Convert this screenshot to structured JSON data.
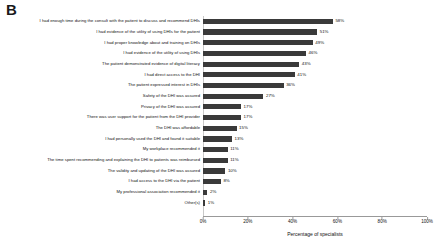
{
  "panel": {
    "label": "B"
  },
  "chart_data": {
    "type": "bar",
    "orientation": "horizontal",
    "title": "",
    "xlabel": "Percentage of specialists",
    "ylabel": "",
    "xlim": [
      0,
      100
    ],
    "grid": false,
    "legend": "none",
    "tick_labels": [
      "0%",
      "20%",
      "40%",
      "60%",
      "80%",
      "100%"
    ],
    "tick_values": [
      0,
      20,
      40,
      60,
      80,
      100
    ],
    "bar_color": "#3a3a3a",
    "categories": [
      "I had enough time during the consult with the patient to discuss and recommend DHIs",
      "I had evidence of the utility of using DHIs for the patient",
      "I had proper knowledge about and training on DHIs",
      "I had evidence of the utility of using DHIs",
      "The patient demonstrated evidence of digital literacy",
      "I had direct access to the DHI",
      "The patient expressed interest in DHIs",
      "Safety of the DHI  was assured",
      "Privacy of the DHI was assured",
      "There was user support for the patient from the DHI provider",
      "The DHI was affordable",
      "I had personally used the DHI and found it suitable",
      "My workplace recommended it",
      "The time spent recommending and explaining the DHI to patients was reimbursed",
      "The validity and updating of the DHI  was assured",
      "I had access to the DHI via the patient",
      "My professional association recommended it",
      "Other(s)"
    ],
    "values": [
      58,
      51,
      49,
      46,
      43,
      41,
      36,
      27,
      17,
      17,
      15,
      13,
      11,
      11,
      10,
      8,
      2,
      1
    ],
    "value_labels": [
      "58%",
      "51%",
      "49%",
      "46%",
      "43%",
      "41%",
      "36%",
      "27%",
      "17%",
      "17%",
      "15%",
      "13%",
      "11%",
      "11%",
      "10%",
      "8%",
      "2%",
      "1%"
    ]
  }
}
